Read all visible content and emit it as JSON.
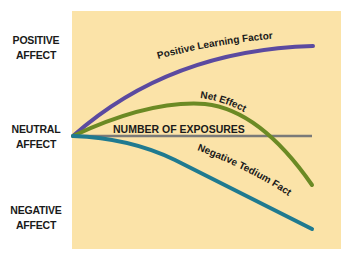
{
  "diagram": {
    "y_labels": {
      "positive": [
        "POSITIVE",
        "AFFECT"
      ],
      "neutral": [
        "NEUTRAL",
        "AFFECT"
      ],
      "negative": [
        "NEGATIVE",
        "AFFECT"
      ]
    },
    "axis_label": "NUMBER OF EXPOSURES",
    "curves": {
      "positive": {
        "label": "Positive Learning Factor",
        "color": "#5b4aa0"
      },
      "net": {
        "label": "Net Effect",
        "color": "#6b8a24"
      },
      "negative": {
        "label": "Negative Tedium Factor",
        "color": "#1f7a90"
      },
      "axis": {
        "color": "#7a7a78"
      }
    },
    "background_color": "#fbe3a8"
  }
}
